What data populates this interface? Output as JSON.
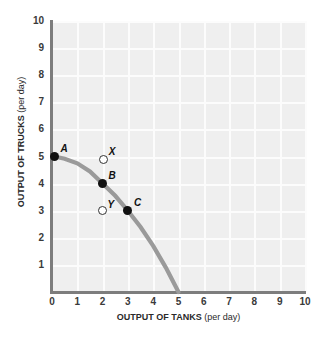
{
  "chart_data": {
    "type": "line",
    "title": "",
    "xlabel_bold": "OUTPUT OF TANKS",
    "xlabel_plain": "(per day)",
    "ylabel_bold": "OUTPUT OF TRUCKS",
    "ylabel_plain": "(per day)",
    "xlim": [
      0,
      10
    ],
    "ylim": [
      0,
      10
    ],
    "xticks": [
      "0",
      "1",
      "2",
      "3",
      "4",
      "5",
      "6",
      "7",
      "8",
      "9",
      "10"
    ],
    "yticks": [
      "1",
      "2",
      "3",
      "4",
      "5",
      "6",
      "7",
      "8",
      "9",
      "10"
    ],
    "grid": true,
    "legend": "none",
    "curve_color": "#9a9a9a",
    "plot_bg": "#efefef",
    "gridline_color": "#fcfcfc",
    "axis_color": "#7d7d7d",
    "series": [
      {
        "name": "production possibilities frontier",
        "type": "line",
        "x": [
          0.1,
          0.5,
          1.0,
          1.5,
          2.0,
          2.5,
          3.0,
          3.5,
          4.0,
          4.5,
          5.0
        ],
        "y": [
          5.0,
          4.92,
          4.75,
          4.45,
          4.0,
          3.55,
          3.0,
          2.4,
          1.7,
          0.9,
          0.0
        ]
      }
    ],
    "points": [
      {
        "label": "A",
        "x": 0.1,
        "y": 5.0,
        "style": "filled",
        "label_dx": 6,
        "label_dy": -13
      },
      {
        "label": "B",
        "x": 2.0,
        "y": 4.0,
        "style": "filled",
        "label_dx": 6,
        "label_dy": -13
      },
      {
        "label": "C",
        "x": 3.0,
        "y": 3.0,
        "style": "filled",
        "label_dx": 6,
        "label_dy": -13
      },
      {
        "label": "X",
        "x": 2.05,
        "y": 4.9,
        "style": "open",
        "label_dx": 5,
        "label_dy": -12
      },
      {
        "label": "Y",
        "x": 2.0,
        "y": 3.0,
        "style": "open",
        "label_dx": 5,
        "label_dy": -11
      }
    ]
  }
}
